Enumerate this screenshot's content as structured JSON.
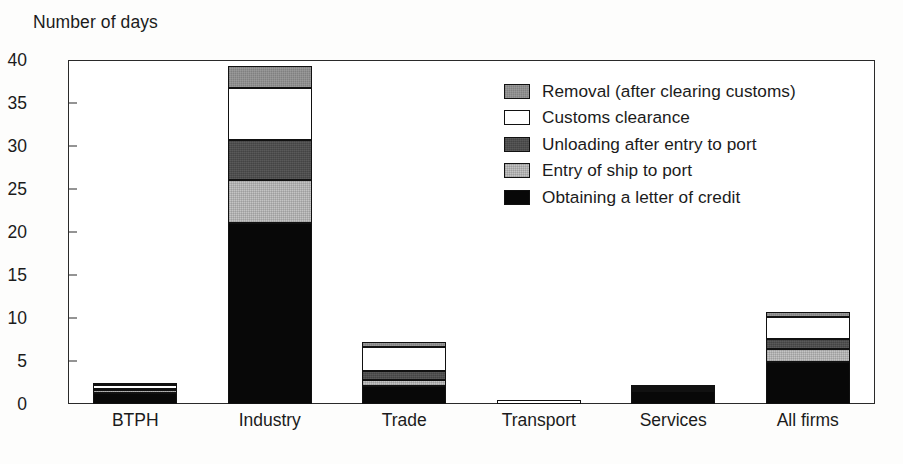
{
  "chart_data": {
    "type": "bar",
    "subtype": "stacked-vertical",
    "title": "",
    "xlabel": "",
    "ylabel": "Number of days",
    "ylim": [
      0,
      40
    ],
    "ytick_values": [
      0,
      5,
      10,
      15,
      20,
      25,
      30,
      35,
      40
    ],
    "ytick_labels": [
      "0",
      "5",
      "10",
      "15",
      "20",
      "25",
      "30",
      "35",
      "40"
    ],
    "grid": false,
    "legend_position": "inside-upper-right",
    "categories": [
      "BTPH",
      "Industry",
      "Trade",
      "Transport",
      "Services",
      "All firms"
    ],
    "series": [
      {
        "name": "Obtaining a letter of credit",
        "color": "#080808",
        "swatch": "black",
        "values": [
          1.3,
          21.0,
          2.1,
          0.0,
          1.5,
          4.9
        ]
      },
      {
        "name": "Entry of ship to port",
        "color": "#c4c4c4",
        "swatch": "light-gray",
        "values": [
          0.3,
          5.0,
          0.7,
          0.0,
          0.2,
          1.5
        ]
      },
      {
        "name": "Unloading after entry to port",
        "color": "#4d4d4d",
        "swatch": "dark-gray",
        "values": [
          0.2,
          4.7,
          1.0,
          0.0,
          0.1,
          1.2
        ]
      },
      {
        "name": "Customs clearance",
        "color": "#ffffff",
        "swatch": "white",
        "values": [
          0.4,
          6.0,
          2.8,
          0.5,
          0.2,
          2.5
        ]
      },
      {
        "name": "Removal (after clearing customs)",
        "color": "#8f8f8f",
        "swatch": "medium-gray",
        "values": [
          0.2,
          2.6,
          0.6,
          0.0,
          0.1,
          0.6
        ]
      }
    ],
    "totals": [
      2.4,
      39.3,
      7.2,
      0.5,
      2.1,
      10.7
    ]
  },
  "legend": {
    "entries": [
      {
        "label": "Removal (after clearing customs)",
        "swatch": "medium-gray"
      },
      {
        "label": "Customs clearance",
        "swatch": "white"
      },
      {
        "label": "Unloading after entry to port",
        "swatch": "dark-gray"
      },
      {
        "label": "Entry of ship to port",
        "swatch": "light-gray"
      },
      {
        "label": "Obtaining a letter of credit",
        "swatch": "black"
      }
    ]
  },
  "colors": {
    "axis": "#2a2a2a",
    "text": "#1b1b1b",
    "background": "#ffffff"
  }
}
